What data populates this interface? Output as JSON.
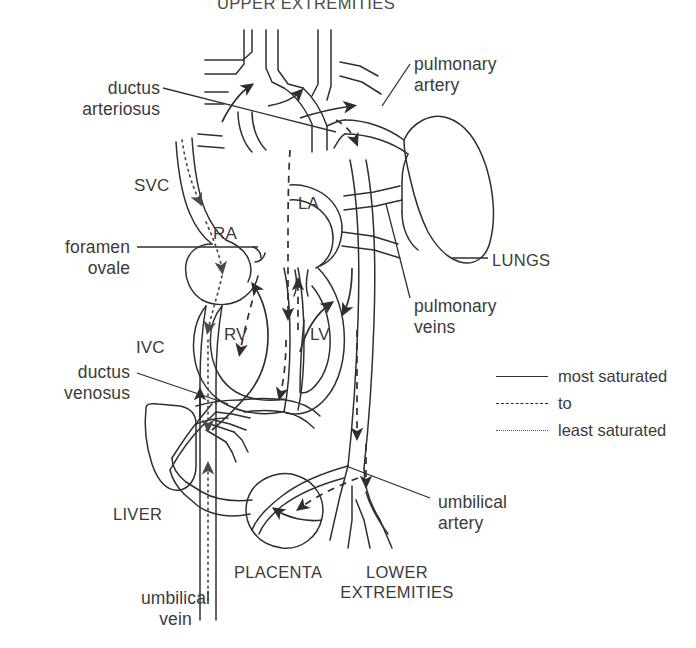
{
  "figure": {
    "kind": "fetal-circulation-diagram",
    "background_color": "#ffffff",
    "ink_color": "#2f2f2f",
    "text_color": "#3b3b3b"
  },
  "titles": {
    "top": "UPPER EXTREMITIES"
  },
  "labels": {
    "ductus_arteriosus": "ductus\narteriosus",
    "svc": "SVC",
    "foramen_ovale": "foramen\novale",
    "ivc": "IVC",
    "ductus_venosus": "ductus\nvenosus",
    "liver": "LIVER",
    "umbilical_vein": "umbilical\nvein",
    "placenta": "PLACENTA",
    "lower_extremities": "LOWER\nEXTREMITIES",
    "umbilical_artery": "umbilical\nartery",
    "pulmonary_artery": "pulmonary\nartery",
    "lungs": "LUNGS",
    "pulmonary_veins": "pulmonary\nveins",
    "ra": "RA",
    "la": "LA",
    "rv": "RV",
    "lv": "LV"
  },
  "legend": {
    "items": [
      {
        "style": "solid",
        "label": "most saturated"
      },
      {
        "style": "dashed",
        "label": "to"
      },
      {
        "style": "dotted",
        "label": "least saturated"
      }
    ]
  }
}
